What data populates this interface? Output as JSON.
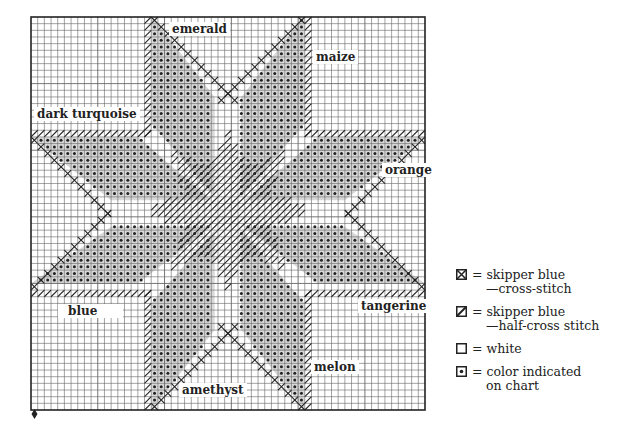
{
  "chart_data": {
    "type": "diagram",
    "title": "",
    "grid_cells": 59,
    "regions": [
      {
        "name": "emerald",
        "position": "top-left petal"
      },
      {
        "name": "maize",
        "position": "top-right petal"
      },
      {
        "name": "dark turquoise",
        "position": "left-top petal"
      },
      {
        "name": "orange",
        "position": "right-top petal"
      },
      {
        "name": "blue",
        "position": "left-bottom petal"
      },
      {
        "name": "tangerine",
        "position": "right-bottom petal"
      },
      {
        "name": "amethyst",
        "position": "bottom-left petal"
      },
      {
        "name": "melon",
        "position": "bottom-right petal"
      }
    ]
  },
  "labels": {
    "emerald": "emerald",
    "maize": "maize",
    "dark_turquoise": "dark turquoise",
    "orange": "orange",
    "blue": "blue",
    "tangerine": "tangerine",
    "melon": "melon",
    "amethyst": "amethyst"
  },
  "legend": [
    {
      "symbol": "cross-box-icon",
      "line1": "= skipper blue",
      "line2": "—cross-stitch"
    },
    {
      "symbol": "half-cross-box-icon",
      "line1": "= skipper blue",
      "line2": "—half-cross stitch"
    },
    {
      "symbol": "empty-box-icon",
      "line1": "= white",
      "line2": ""
    },
    {
      "symbol": "dot-box-icon",
      "line1": "= color indicated",
      "line2": "on chart"
    }
  ],
  "colors": {
    "ink": "#222222",
    "grid": "#555555",
    "paper": "#ffffff"
  }
}
